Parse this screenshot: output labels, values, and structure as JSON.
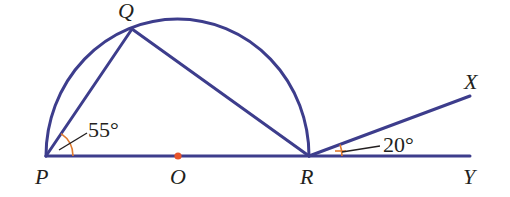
{
  "figure": {
    "type": "geometry-diagram",
    "colors": {
      "line": "#3d3d8c",
      "angle_mark": "#e07a2e",
      "centre_point": "#e8542a",
      "text": "#231f20"
    },
    "points": {
      "P": {
        "label": "P",
        "x": 46,
        "y": 156
      },
      "O": {
        "label": "O",
        "x": 178,
        "y": 156
      },
      "R": {
        "label": "R",
        "x": 309,
        "y": 156
      },
      "Q": {
        "label": "Q",
        "x": 132,
        "y": 29
      },
      "X": {
        "label": "X",
        "x": 470,
        "y": 96
      },
      "Y": {
        "label": "Y",
        "x": 470,
        "y": 156
      }
    },
    "angles": {
      "QPR": {
        "label": "55°",
        "value": 55
      },
      "XRY": {
        "label": "20°",
        "value": 20
      }
    },
    "segments": [
      "PQ",
      "QR",
      "PR",
      "RY",
      "RX"
    ],
    "arcs": [
      "semicircle PQR centred at O"
    ]
  }
}
